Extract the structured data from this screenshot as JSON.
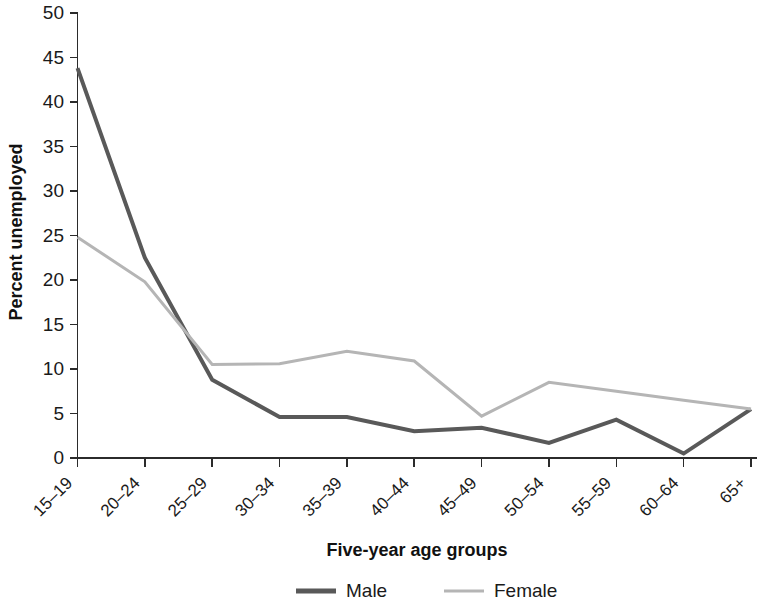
{
  "chart_data": {
    "type": "line",
    "title": "",
    "xlabel": "Five-year age groups",
    "ylabel": "Percent unemployed",
    "categories": [
      "15–19",
      "20–24",
      "25–29",
      "30–34",
      "35–39",
      "40–44",
      "45–49",
      "50–54",
      "55–59",
      "60–64",
      "65+"
    ],
    "series": [
      {
        "name": "Male",
        "color": "#595959",
        "line_width": 4,
        "values": [
          43.8,
          22.5,
          8.8,
          4.6,
          4.6,
          3.0,
          3.4,
          1.7,
          4.3,
          0.5,
          5.5
        ]
      },
      {
        "name": "Female",
        "color": "#b5b5b5",
        "line_width": 3,
        "values": [
          24.8,
          19.8,
          10.5,
          10.6,
          12.0,
          10.9,
          4.7,
          8.5,
          7.5,
          6.5,
          5.5
        ]
      }
    ],
    "ylim": [
      0,
      50
    ],
    "yticks": [
      0,
      5,
      10,
      15,
      20,
      25,
      30,
      35,
      40,
      45,
      50
    ],
    "ytick_labels": [
      "0",
      "5",
      "10",
      "15",
      "20",
      "25",
      "30",
      "35",
      "40",
      "45",
      "50"
    ],
    "grid": false,
    "legend_position": "bottom",
    "legend": [
      {
        "label": "Male",
        "color": "#595959",
        "line_width": 5
      },
      {
        "label": "Female",
        "color": "#b5b5b5",
        "line_width": 3
      }
    ]
  },
  "axis_titles": {
    "x": "Five-year age groups",
    "y": "Percent unemployed"
  }
}
